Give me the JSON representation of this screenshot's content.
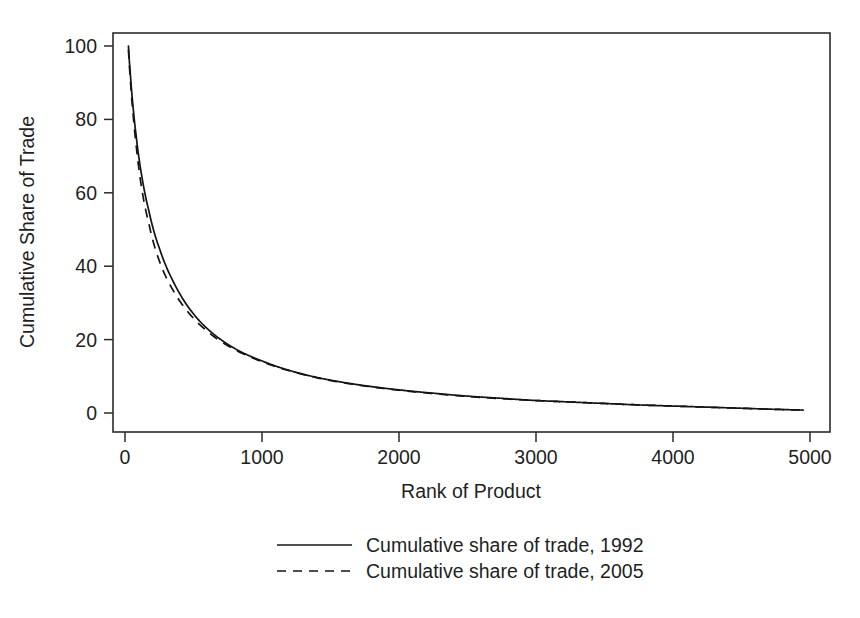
{
  "chart_data": {
    "type": "line",
    "title": "",
    "xlabel": "Rank of Product",
    "ylabel": "Cumulative Share of Trade",
    "xlim": [
      0,
      5000
    ],
    "ylim": [
      0,
      100
    ],
    "xticks": [
      "0",
      "1000",
      "2000",
      "3000",
      "4000",
      "5000"
    ],
    "yticks": [
      "0",
      "20",
      "40",
      "60",
      "80",
      "100"
    ],
    "xtick_values": [
      0,
      1000,
      2000,
      3000,
      4000,
      5000
    ],
    "ytick_values": [
      0,
      20,
      40,
      60,
      80,
      100
    ],
    "grid": false,
    "frame": "box",
    "legend_position": "below-axes",
    "legend": [
      "Cumulative share of trade, 1992",
      "Cumulative share of trade, 2005"
    ],
    "series": [
      {
        "name": "Cumulative share of trade, 1992",
        "style": "solid",
        "color": "#141414",
        "x": [
          25,
          40,
          60,
          80,
          100,
          125,
          150,
          175,
          200,
          250,
          300,
          350,
          400,
          450,
          500,
          600,
          700,
          800,
          900,
          1000,
          1200,
          1400,
          1600,
          1800,
          2000,
          2250,
          2500,
          2750,
          3000,
          3250,
          3500,
          3750,
          4000,
          4250,
          4500,
          4750,
          4950
        ],
        "y": [
          100,
          92,
          83,
          76,
          70,
          64,
          59,
          55,
          51,
          45,
          40,
          36,
          32.5,
          29.5,
          27,
          23,
          20,
          17.6,
          15.7,
          14.2,
          11.6,
          9.7,
          8.3,
          7.2,
          6.3,
          5.4,
          4.6,
          4.0,
          3.4,
          3.0,
          2.6,
          2.2,
          1.9,
          1.6,
          1.3,
          1.0,
          0.8
        ]
      },
      {
        "name": "Cumulative share of trade, 2005",
        "style": "dashed",
        "color": "#141414",
        "x": [
          25,
          40,
          60,
          80,
          100,
          125,
          150,
          175,
          200,
          250,
          300,
          350,
          400,
          450,
          500,
          600,
          700,
          800,
          900,
          1000,
          1200,
          1400,
          1600,
          1800,
          2000,
          2250,
          2500,
          2750,
          3000,
          3250,
          3500,
          3750,
          4000,
          4250,
          4500,
          4750,
          4950
        ],
        "y": [
          99,
          90.5,
          81,
          73.5,
          67,
          60.5,
          55.5,
          51.5,
          47.5,
          41.5,
          37,
          33.5,
          30.5,
          28,
          25.8,
          22.3,
          19.5,
          17.3,
          15.5,
          14.0,
          11.5,
          9.6,
          8.2,
          7.1,
          6.2,
          5.3,
          4.5,
          3.9,
          3.4,
          3.0,
          2.6,
          2.2,
          1.9,
          1.6,
          1.3,
          1.0,
          0.8
        ]
      }
    ]
  }
}
